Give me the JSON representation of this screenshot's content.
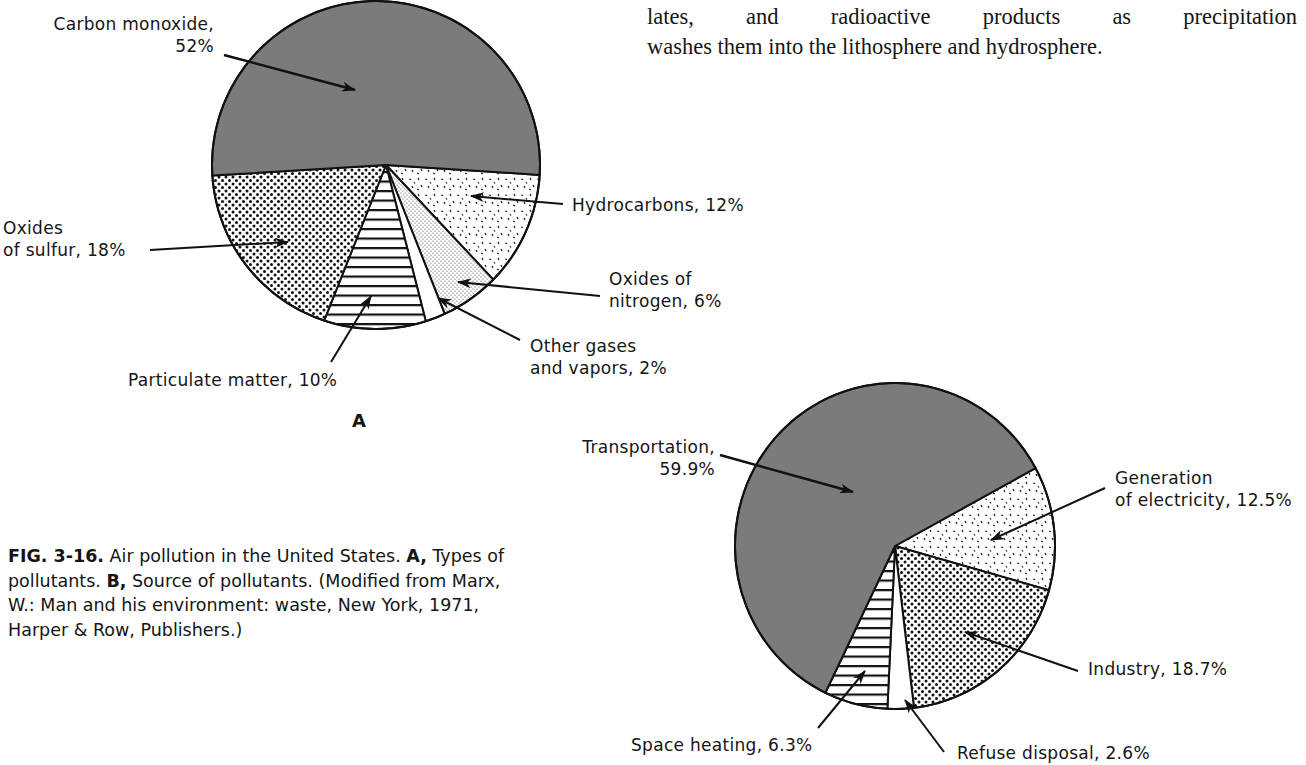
{
  "body_text": {
    "line1": "lates, and radioactive products as precipitation",
    "line2": "washes them into the lithosphere and hydrosphere."
  },
  "caption": {
    "fig_label": "FIG. 3-16.",
    "part1": " Air pollution in the United States. ",
    "a_label": "A,",
    "part2": " Types of pollutants. ",
    "b_label": "B,",
    "part3": " Source of pollutants. (Modified from Marx, W.: Man and his environment: waste, New York, 1971, Harper & Row, Publishers.)"
  },
  "colors": {
    "dark_fill": "#7b7b7b",
    "outline": "#111111",
    "background": "#ffffff"
  },
  "chart_data": [
    {
      "type": "pie",
      "panel": "A",
      "title": "Types of pollutants",
      "start_angle_deg": 3.7,
      "slices": [
        {
          "name": "Hydrocarbons",
          "value": 12,
          "label": "Hydrocarbons, 12%",
          "pattern": "dashes"
        },
        {
          "name": "Oxides of nitrogen",
          "value": 6,
          "label": "Oxides of\nnitrogen, 6%",
          "pattern": "fine-dots"
        },
        {
          "name": "Other gases and vapors",
          "value": 2,
          "label": "Other gases\nand vapors, 2%",
          "pattern": "white"
        },
        {
          "name": "Particulate matter",
          "value": 10,
          "label": "Particulate matter, 10%",
          "pattern": "hlines"
        },
        {
          "name": "Oxides of sulfur",
          "value": 18,
          "label": "Oxides\nof sulfur, 18%",
          "pattern": "dots"
        },
        {
          "name": "Carbon monoxide",
          "value": 52,
          "label": "Carbon monoxide,\n52%",
          "pattern": "solid-gray"
        }
      ]
    },
    {
      "type": "pie",
      "panel": "B",
      "title": "Source of pollutants",
      "start_angle_deg": -29,
      "slices": [
        {
          "name": "Generation of electricity",
          "value": 12.5,
          "label": "Generation\nof electricity, 12.5%",
          "pattern": "dashes"
        },
        {
          "name": "Industry",
          "value": 18.7,
          "label": "Industry, 18.7%",
          "pattern": "dots"
        },
        {
          "name": "Refuse disposal",
          "value": 2.6,
          "label": "Refuse disposal, 2.6%",
          "pattern": "white"
        },
        {
          "name": "Space heating",
          "value": 6.3,
          "label": "Space heating, 6.3%",
          "pattern": "hlines"
        },
        {
          "name": "Transportation",
          "value": 59.9,
          "label": "Transportation,\n59.9%",
          "pattern": "solid-gray"
        }
      ]
    }
  ],
  "panels": {
    "a_letter": "A",
    "a_labels": {
      "carbon_monoxide": "Carbon monoxide,\n52%",
      "hydrocarbons": "Hydrocarbons, 12%",
      "oxides_of_sulfur": "Oxides\nof sulfur, 18%",
      "oxides_of_nitrogen": "Oxides of\nnitrogen, 6%",
      "other_gases": "Other gases\nand vapors, 2%",
      "particulate": "Particulate matter, 10%"
    },
    "b_labels": {
      "transportation": "Transportation,\n59.9%",
      "electricity": "Generation\nof electricity, 12.5%",
      "industry": "Industry, 18.7%",
      "space_heating": "Space heating, 6.3%",
      "refuse": "Refuse disposal, 2.6%"
    }
  }
}
